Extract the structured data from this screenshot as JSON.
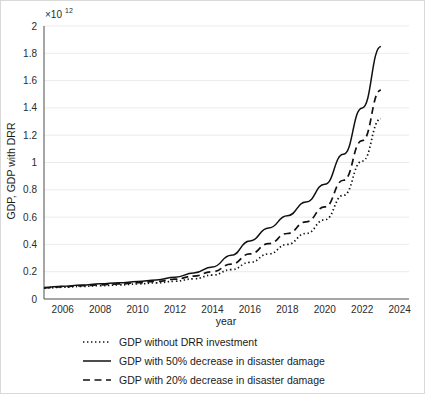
{
  "chart_data": {
    "type": "line",
    "title": "",
    "xlabel": "year",
    "ylabel": "GDP, GDP with DRR",
    "y_multiplier_base": "×10",
    "y_multiplier_exponent": "12",
    "y_multiplier_label": "×10¹²",
    "xlim": [
      2005,
      2024.5
    ],
    "ylim": [
      0,
      2
    ],
    "x_ticks": [
      2006,
      2008,
      2010,
      2012,
      2014,
      2016,
      2018,
      2020,
      2022,
      2024
    ],
    "y_ticks": [
      0,
      0.2,
      0.4,
      0.6,
      0.8,
      1,
      1.2,
      1.4,
      1.6,
      1.8,
      2
    ],
    "y_tick_labels": [
      "0",
      "0.2",
      "0.4",
      "0.6",
      "0.8",
      "1",
      "1.2",
      "1.4",
      "1.6",
      "1.8",
      "2"
    ],
    "x_tick_labels": [
      "2006",
      "2008",
      "2010",
      "2012",
      "2014",
      "2016",
      "2018",
      "2020",
      "2022",
      "2024"
    ],
    "grid": "horizontal",
    "legend_position": "below",
    "x": [
      2005,
      2006,
      2007,
      2008,
      2009,
      2010,
      2011,
      2012,
      2013,
      2014,
      2015,
      2016,
      2017,
      2018,
      2019,
      2020,
      2021,
      2022,
      2023
    ],
    "series": [
      {
        "name": "GDP without DRR investment",
        "style": "dotted",
        "color": "#111111",
        "values": [
          0.08,
          0.086,
          0.092,
          0.098,
          0.103,
          0.11,
          0.118,
          0.13,
          0.148,
          0.175,
          0.215,
          0.268,
          0.33,
          0.4,
          0.48,
          0.58,
          0.76,
          1.01,
          1.32
        ]
      },
      {
        "name": "GDP with 50% decrease in disaster damage",
        "style": "solid",
        "color": "#111111",
        "values": [
          0.085,
          0.094,
          0.102,
          0.111,
          0.119,
          0.128,
          0.14,
          0.16,
          0.19,
          0.235,
          0.32,
          0.425,
          0.52,
          0.61,
          0.71,
          0.84,
          1.06,
          1.4,
          1.85
        ]
      },
      {
        "name": "GDP with 20% decrease in disaster damage",
        "style": "dashed",
        "color": "#111111",
        "values": [
          0.082,
          0.09,
          0.097,
          0.104,
          0.111,
          0.119,
          0.129,
          0.145,
          0.168,
          0.2,
          0.255,
          0.33,
          0.405,
          0.48,
          0.565,
          0.675,
          0.87,
          1.16,
          1.53
        ]
      }
    ]
  },
  "legend": {
    "items": [
      {
        "label": "GDP without DRR investment",
        "style": "dotted"
      },
      {
        "label": "GDP with 50% decrease in disaster damage",
        "style": "solid"
      },
      {
        "label": "GDP with 20% decrease in disaster damage",
        "style": "dashed"
      }
    ]
  }
}
